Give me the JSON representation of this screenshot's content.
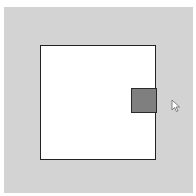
{
  "scene": {
    "background_color": "#d3d3d3",
    "container": {
      "role": "drop-zone",
      "fill": "#ffffff",
      "border_color": "#222222"
    },
    "draggable_block": {
      "role": "draggable",
      "fill": "#7f7f7f",
      "border_color": "#2a2a2a"
    },
    "cursor": {
      "icon": "mouse-pointer-icon"
    }
  }
}
